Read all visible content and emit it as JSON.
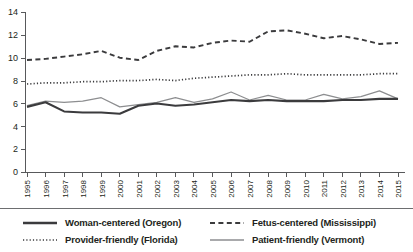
{
  "chart_data": {
    "type": "line",
    "title": "",
    "xlabel": "",
    "ylabel": "",
    "grid": false,
    "legend_position": "bottom",
    "ylim": [
      0,
      14
    ],
    "yticks": [
      0,
      2,
      4,
      6,
      8,
      10,
      12,
      14
    ],
    "ytick_labels": [
      "0",
      "2",
      "4",
      "6",
      "8",
      "10",
      "12",
      "14"
    ],
    "x": [
      1995,
      1996,
      1997,
      1998,
      1999,
      2000,
      2001,
      2002,
      2003,
      2004,
      2005,
      2006,
      2007,
      2008,
      2009,
      2010,
      2011,
      2012,
      2013,
      2014,
      2015
    ],
    "xtick_labels": [
      "1995",
      "1996",
      "1997",
      "1998",
      "1999",
      "2000",
      "2001",
      "2002",
      "2003",
      "2004",
      "2005",
      "2006",
      "2007",
      "2008",
      "2009",
      "2010",
      "2011",
      "2012",
      "2013",
      "2014",
      "2015"
    ],
    "series": [
      {
        "name": "Woman-centered (Oregon)",
        "style": "solid-thick",
        "color": "#3b3b3d",
        "values": [
          5.7,
          6.1,
          5.3,
          5.2,
          5.2,
          5.1,
          5.8,
          6.0,
          5.8,
          5.9,
          6.1,
          6.3,
          6.2,
          6.3,
          6.2,
          6.2,
          6.2,
          6.3,
          6.3,
          6.4,
          6.4
        ]
      },
      {
        "name": "Fetus-centered (Mississippi)",
        "style": "dashed",
        "color": "#3b3b3d",
        "values": [
          9.8,
          9.9,
          10.1,
          10.3,
          10.6,
          10.0,
          9.8,
          10.6,
          11.0,
          10.9,
          11.3,
          11.5,
          11.4,
          12.3,
          12.4,
          12.1,
          11.7,
          11.9,
          11.6,
          11.2,
          11.3
        ]
      },
      {
        "name": "Provider-friendly (Florida)",
        "style": "dotted",
        "color": "#3b3b3d",
        "values": [
          7.7,
          7.8,
          7.8,
          7.9,
          7.9,
          8.0,
          8.0,
          8.1,
          8.0,
          8.2,
          8.3,
          8.4,
          8.5,
          8.5,
          8.6,
          8.5,
          8.5,
          8.5,
          8.5,
          8.6,
          8.6
        ]
      },
      {
        "name": "Patient-friendly (Vermont)",
        "style": "solid-thin",
        "color": "#8d8e90",
        "values": [
          5.8,
          6.2,
          6.1,
          6.2,
          6.5,
          5.7,
          5.9,
          6.1,
          6.5,
          6.1,
          6.4,
          7.0,
          6.3,
          6.7,
          6.3,
          6.3,
          6.8,
          6.4,
          6.6,
          7.1,
          6.4
        ]
      }
    ]
  },
  "legend": {
    "entries": [
      {
        "label": "Woman-centered (Oregon)",
        "icon": "solid-thick-line-icon"
      },
      {
        "label": "Fetus-centered (Mississippi)",
        "icon": "dashed-line-icon"
      },
      {
        "label": "Provider-friendly (Florida)",
        "icon": "dotted-line-icon"
      },
      {
        "label": "Patient-friendly (Vermont)",
        "icon": "solid-thin-line-icon"
      }
    ]
  }
}
